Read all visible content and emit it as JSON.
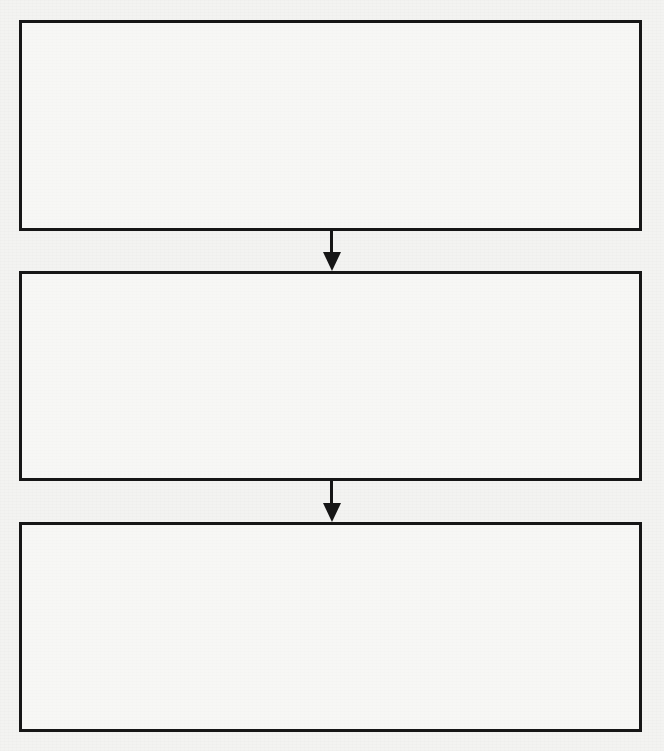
{
  "diagram": {
    "type": "flowchart",
    "direction": "top-to-bottom",
    "colors": {
      "background": "#f3f3f1",
      "stroke": "#161616"
    },
    "boxes": [
      {
        "id": "box-1",
        "label": ""
      },
      {
        "id": "box-2",
        "label": ""
      },
      {
        "id": "box-3",
        "label": ""
      }
    ],
    "arrows": [
      {
        "from": "box-1",
        "to": "box-2",
        "icon": "arrow-down-icon"
      },
      {
        "from": "box-2",
        "to": "box-3",
        "icon": "arrow-down-icon"
      }
    ]
  }
}
